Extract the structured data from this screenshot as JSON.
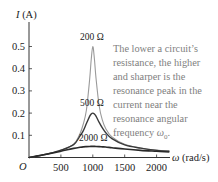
{
  "chart_data": {
    "type": "line",
    "title": "",
    "xlabel": "ω (rad/s)",
    "ylabel": "I (A)",
    "origin_label": "O",
    "xlim": [
      0,
      2200
    ],
    "ylim": [
      0,
      0.55
    ],
    "xticks": [
      500,
      1000,
      1500,
      2000
    ],
    "xtick_labels": [
      "500",
      "1000",
      "1500",
      "2000"
    ],
    "yticks": [
      0.1,
      0.2,
      0.3,
      0.4,
      0.5
    ],
    "ytick_labels": [
      "0.1",
      "0.2",
      "0.3",
      "0.4",
      "0.5"
    ],
    "grid": false,
    "x": [
      0,
      100,
      300,
      500,
      700,
      800,
      850,
      900,
      950,
      975,
      1000,
      1025,
      1050,
      1100,
      1150,
      1200,
      1300,
      1500,
      1750,
      2000,
      2200
    ],
    "series": [
      {
        "name": "200 Ω",
        "label": "200 Ω",
        "color": "#9a9a9a",
        "width": 1.1,
        "values": [
          0,
          0.005,
          0.017,
          0.033,
          0.06,
          0.108,
          0.15,
          0.214,
          0.35,
          0.44,
          0.5,
          0.445,
          0.358,
          0.232,
          0.168,
          0.132,
          0.093,
          0.06,
          0.043,
          0.033,
          0.029
        ]
      },
      {
        "name": "500 Ω",
        "label": "500 Ω",
        "color": "#3a3a3a",
        "width": 1.4,
        "values": [
          0,
          0.005,
          0.017,
          0.033,
          0.058,
          0.097,
          0.12,
          0.153,
          0.185,
          0.196,
          0.2,
          0.196,
          0.186,
          0.158,
          0.133,
          0.113,
          0.085,
          0.057,
          0.042,
          0.032,
          0.028
        ]
      },
      {
        "name": "2000 Ω",
        "label": "2000 Ω",
        "color": "#2a2a2a",
        "width": 1.6,
        "values": [
          0,
          0.005,
          0.016,
          0.028,
          0.041,
          0.046,
          0.048,
          0.049,
          0.0497,
          0.0499,
          0.05,
          0.0499,
          0.0497,
          0.049,
          0.048,
          0.047,
          0.044,
          0.038,
          0.032,
          0.028,
          0.025
        ]
      }
    ],
    "annotation": {
      "lines": [
        "The lower a circuit’s",
        "resistance, the higher",
        "and sharper is the",
        "resonance peak in the",
        "current near the",
        "resonance angular",
        "frequency ω0."
      ]
    },
    "legend_position": "inline labels on curves"
  },
  "labels": {
    "ylabel": "I (A)",
    "xlabel": "ω (rad/s)",
    "origin": "O",
    "r200": "200 Ω",
    "r500": "500 Ω",
    "r2000": "2000 Ω"
  },
  "note": {
    "l0": "The lower a circuit’s",
    "l1": "resistance, the higher",
    "l2": "and sharper is the",
    "l3": "resonance peak in the",
    "l4": "current near the",
    "l5": "resonance angular",
    "l6_prefix": "frequency ",
    "l6_omega": "ω",
    "l6_sub": "0",
    "l6_suffix": "."
  }
}
